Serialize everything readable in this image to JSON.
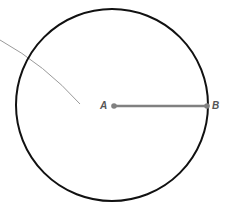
{
  "diagram": {
    "circle": {
      "cx": 112,
      "cy": 105,
      "r": 96,
      "color": "#111111"
    },
    "center_point": {
      "label": "A",
      "x": 114,
      "y": 106
    },
    "edge_point": {
      "label": "B",
      "x": 207,
      "y": 106
    },
    "radius_segment": {
      "color": "#808080"
    },
    "arc_line": {
      "color": "#999999"
    }
  }
}
